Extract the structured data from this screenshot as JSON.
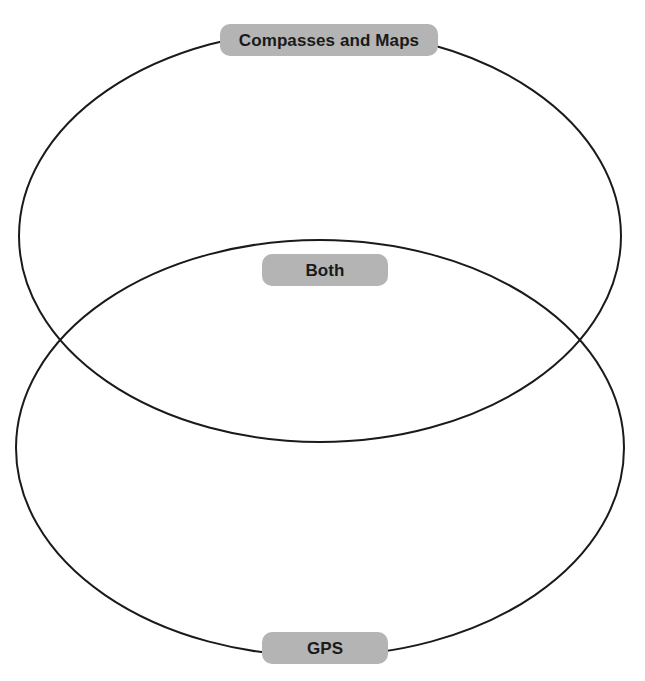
{
  "diagram": {
    "type": "venn-diagram",
    "sets": 2,
    "background_color": "#ffffff",
    "stroke_color": "#1a1a1a",
    "label_background_color": "#b4b4b4",
    "label_text_color": "#1a1a1a",
    "regions": [
      {
        "id": "top",
        "label": "Compasses and Maps",
        "position": "top",
        "items": []
      },
      {
        "id": "overlap",
        "label": "Both",
        "position": "center",
        "items": []
      },
      {
        "id": "bottom",
        "label": "GPS",
        "position": "bottom",
        "items": []
      }
    ],
    "ellipses": [
      {
        "id": "top-ellipse",
        "name": "compasses-and-maps-ellipse",
        "cx": 320,
        "cy": 236,
        "rx": 301,
        "ry": 206
      },
      {
        "id": "bottom-ellipse",
        "name": "gps-ellipse",
        "cx": 320,
        "cy": 448,
        "rx": 304,
        "ry": 208
      }
    ]
  }
}
